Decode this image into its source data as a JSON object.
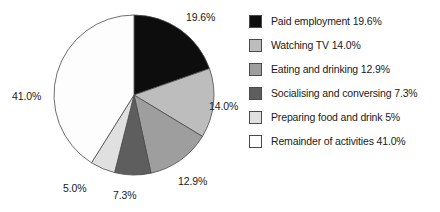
{
  "chart_data": {
    "type": "pie",
    "title": "",
    "unit": "percent",
    "start_angle_deg": 0,
    "direction": "clockwise",
    "legend_position": "right",
    "categories": [
      "Paid employment",
      "Watching TV",
      "Eating and drinking",
      "Socialising and conversing",
      "Preparing food and drink",
      "Remainder of activities"
    ],
    "values": [
      19.6,
      14.0,
      12.9,
      7.3,
      5.0,
      41.0
    ],
    "slice_labels": [
      "19.6%",
      "14.0%",
      "12.9%",
      "7.3%",
      "5.0%",
      "41.0%"
    ],
    "legend_labels": [
      "Paid employment 19.6%",
      "Watching TV 14.0%",
      "Eating and drinking 12.9%",
      "Socialising and conversing 7.3%",
      "Preparing food and drink 5%",
      "Remainder of activities 41.0%"
    ],
    "colors": [
      "#0d0d0d",
      "#bdbdbd",
      "#9e9e9e",
      "#5e5e5e",
      "#e0e0e0",
      "#fdfdfd"
    ],
    "edge_color": "#4a4a4a"
  },
  "legend": {
    "items": [
      {
        "label": "Paid employment 19.6%",
        "color": "#0d0d0d"
      },
      {
        "label": "Watching TV 14.0%",
        "color": "#bdbdbd"
      },
      {
        "label": "Eating and drinking 12.9%",
        "color": "#9e9e9e"
      },
      {
        "label": "Socialising and conversing 7.3%",
        "color": "#5e5e5e"
      },
      {
        "label": "Preparing food and drink 5%",
        "color": "#e0e0e0"
      },
      {
        "label": "Remainder of activities 41.0%",
        "color": "#fdfdfd"
      }
    ]
  },
  "pie_geometry": {
    "cx": 134,
    "cy": 95,
    "r": 80
  }
}
